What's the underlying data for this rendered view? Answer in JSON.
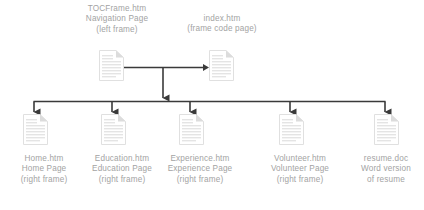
{
  "diagram": {
    "type": "website-frameset-hierarchy",
    "background_color": "#ffffff",
    "text_color": "#a3a3a3",
    "connector_color": "#3a3a3a",
    "icon_color": "#e2e2e2",
    "top_nodes": [
      {
        "id": "tocframe",
        "icon": "document-icon",
        "line1": "TOCFrame.htm",
        "line2": "Navigation Page",
        "line3": "(left frame)"
      },
      {
        "id": "index",
        "icon": "document-icon",
        "line1": "index.htm",
        "line2": "(frame code page)",
        "line3": ""
      }
    ],
    "bottom_nodes": [
      {
        "id": "home",
        "icon": "document-icon",
        "line1": "Home.htm",
        "line2": "Home Page",
        "line3": "(right frame)"
      },
      {
        "id": "education",
        "icon": "document-icon",
        "line1": "Education.htm",
        "line2": "Education Page",
        "line3": "(right frame)"
      },
      {
        "id": "experience",
        "icon": "document-icon",
        "line1": "Experience.htm",
        "line2": "Experience Page",
        "line3": "(right frame)"
      },
      {
        "id": "volunteer",
        "icon": "document-icon",
        "line1": "Volunteer.htm",
        "line2": "Volunteer Page",
        "line3": "(right frame)"
      },
      {
        "id": "resume",
        "icon": "document-icon",
        "line1": "resume.doc",
        "line2": "Word version",
        "line3": "of resume"
      }
    ],
    "connectors": {
      "horizontal_double_arrow": "bidirectional link between TOCFrame.htm and index.htm",
      "center_down_arrow": "from frameset center down to distribution bus",
      "bus_drop_arrows": "five downward arrows to each bottom page"
    }
  }
}
